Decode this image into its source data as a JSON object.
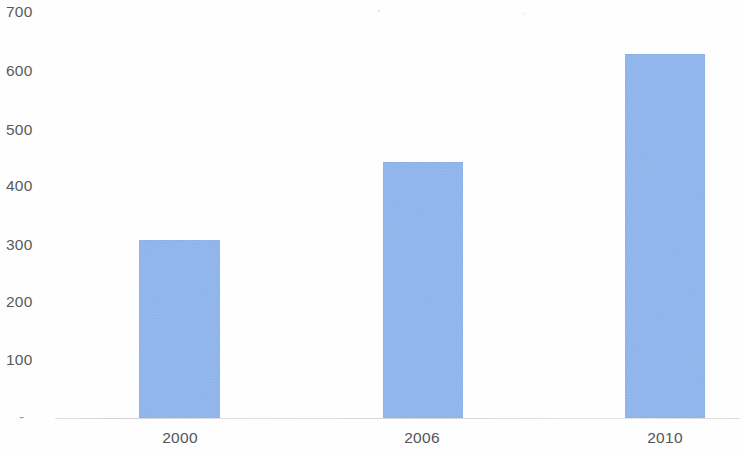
{
  "chart_data": {
    "type": "bar",
    "title": "",
    "subtitle": "",
    "xlabel": "",
    "ylabel": "",
    "categories": [
      "2000",
      "2006",
      "2010"
    ],
    "values": [
      302,
      434,
      617
    ],
    "series": [
      {
        "name": "",
        "values": [
          302,
          434,
          617
        ]
      }
    ],
    "ylim": [
      0,
      700
    ],
    "y_ticks": [
      "700",
      "600",
      "500",
      "400",
      "300",
      "200",
      "100",
      "-"
    ],
    "y_tick_values": [
      700,
      600,
      500,
      400,
      300,
      200,
      100,
      0
    ],
    "grid": false,
    "legend": false,
    "legend_position": "none",
    "bar_color": "#8fb5ec",
    "axis_color": "#b0b0b2",
    "tick_label_color": "#5a5a5c",
    "background_color": "#ffffff"
  },
  "axes": {
    "y": {
      "ticks": [
        {
          "label": "700",
          "value": 700,
          "top": 4
        },
        {
          "label": "600",
          "value": 600,
          "top": 63
        },
        {
          "label": "500",
          "value": 500,
          "top": 122
        },
        {
          "label": "400",
          "value": 400,
          "top": 178
        },
        {
          "label": "300",
          "value": 300,
          "top": 237
        },
        {
          "label": "200",
          "value": 200,
          "top": 294
        },
        {
          "label": "100",
          "value": 100,
          "top": 352
        },
        {
          "label": "-",
          "value": 0,
          "top": 409
        }
      ]
    },
    "x": {
      "ticks": [
        {
          "label": "2000",
          "center": 180
        },
        {
          "label": "2006",
          "center": 422
        },
        {
          "label": "2010",
          "center": 665
        }
      ]
    }
  },
  "bars": [
    {
      "label": "2000",
      "value": 302,
      "left": 139,
      "width": 81,
      "height": 176,
      "color": "#8fb5ec"
    },
    {
      "label": "2006",
      "value": 434,
      "left": 383,
      "width": 80,
      "height": 253,
      "color": "#8fb5ec"
    },
    {
      "label": "2010",
      "value": 617,
      "left": 625,
      "width": 80,
      "height": 357,
      "color": "#8fb5ec"
    }
  ]
}
